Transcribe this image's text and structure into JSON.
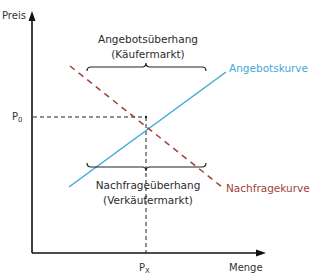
{
  "diagram": {
    "type": "supply-demand-diagram",
    "axes": {
      "y_label": "Preis",
      "x_label": "Menge",
      "price_marker": {
        "main": "P",
        "sub": "0"
      },
      "quantity_marker": {
        "main": "P",
        "sub": "X"
      }
    },
    "curves": {
      "supply": {
        "label": "Angebotskurve",
        "color": "#3fa9d9",
        "style": "solid"
      },
      "demand": {
        "label": "Nachfragekurve",
        "color": "#a0413a",
        "style": "dashed"
      }
    },
    "regions": {
      "surplus": {
        "line1": "Angebotsüberhang",
        "line2": "(Käufermarkt)"
      },
      "shortage": {
        "line1": "Nachfrageüberhang",
        "line2": "(Verkäufermarkt)"
      }
    },
    "colors": {
      "axis": "#111111",
      "guide": "#222222",
      "bracket": "#222222"
    }
  }
}
